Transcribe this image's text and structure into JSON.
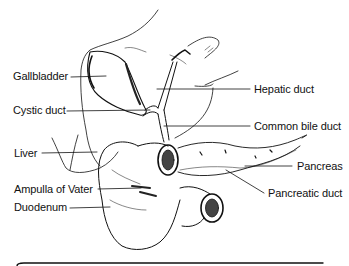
{
  "figure": {
    "type": "anatomical illustration",
    "line_color": "#111111",
    "background": "#ffffff"
  },
  "labels": {
    "gallbladder": "Gallbladder",
    "cystic_duct": "Cystic duct",
    "liver": "Liver",
    "ampulla_of_vater": "Ampulla of Vater",
    "duodenum": "Duodenum",
    "hepatic_duct": "Hepatic duct",
    "common_bile_duct": "Common bile duct",
    "pancreas": "Pancreas",
    "pancreatic_duct": "Pancreatic duct"
  }
}
